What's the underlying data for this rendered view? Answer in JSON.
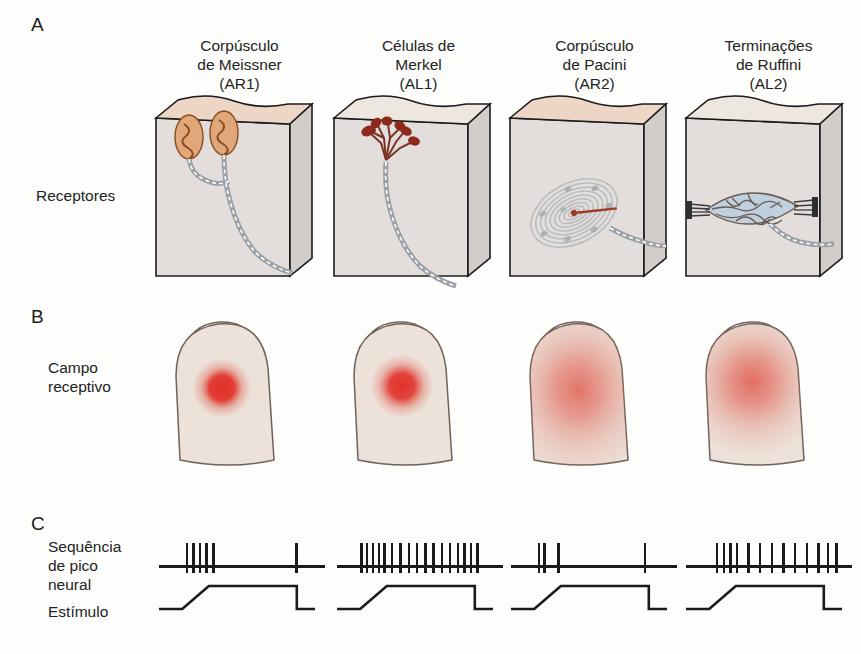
{
  "figure": {
    "panels": [
      {
        "letter": "A",
        "row_label": "Receptores"
      },
      {
        "letter": "B",
        "row_label": "Campo\nreceptivo"
      },
      {
        "letter": "C",
        "row_label_spikes": "Sequência\nde pico\nneural",
        "row_label_stimulus": "Estímulo"
      }
    ]
  },
  "columns": [
    {
      "id": "meissner",
      "title": "Corpúsculo\nde Meissner",
      "code": "(AR1)"
    },
    {
      "id": "merkel",
      "title": "Células de\nMerkel",
      "code": "(AL1)"
    },
    {
      "id": "pacini",
      "title": "Corpúsculo\nde Pacini",
      "code": "(AR2)"
    },
    {
      "id": "ruffini",
      "title": "Terminações\nde Ruffini",
      "code": "(AL2)"
    }
  ],
  "colors": {
    "skin_top": "#eed6c6",
    "skin_front": "#e3dedb",
    "skin_side": "#d2cdc9",
    "outline": "#1b1b1b",
    "meissner_capsule": "#e0a878",
    "meissner_fiber": "#8a4a20",
    "merkel_cell": "#8e2a1c",
    "merkel_branch": "#7a3322",
    "nerve": "#9aa0a6",
    "pacini_lamella": "#b9bcbf",
    "pacini_core": "#9c3b22",
    "ruffini_capsule": "#bfd0de",
    "ruffini_fiber": "#6b5a52",
    "receptive_field": "#e03028",
    "finger_fill": "#ece2da",
    "finger_outline": "#6e625a",
    "trace": "#1b1b1b"
  },
  "chart_data": {
    "type": "line",
    "stimulus": {
      "label": "Estímulo",
      "shape": "trapezoid",
      "baseline_end_pct": 14,
      "ramp_end_pct": 30,
      "plateau_end_pct": 83,
      "offset_end_pct": 88,
      "amplitude": 1.0
    },
    "series": [
      {
        "name": "Corpúsculo de Meissner (AR1)",
        "code": "AR1",
        "adaptation": "rapidamente adaptativo",
        "receptive_field_size": "pequeno",
        "spike_count": 6,
        "spike_times_pct": [
          16,
          20,
          24,
          28,
          32,
          82
        ]
      },
      {
        "name": "Células de Merkel (AL1)",
        "code": "AL1",
        "adaptation": "lentamente adaptativo",
        "receptive_field_size": "pequeno",
        "spike_count": 17,
        "spike_times_pct": [
          14,
          17.5,
          21,
          24.5,
          28,
          32.5,
          37.5,
          42.5,
          47.5,
          52.5,
          57.5,
          62.5,
          67.5,
          72,
          76,
          80,
          84
        ]
      },
      {
        "name": "Corpúsculo de Pacini (AR2)",
        "code": "AR2",
        "adaptation": "rapidamente adaptativo",
        "receptive_field_size": "grande",
        "spike_count": 4,
        "spike_times_pct": [
          16,
          19.5,
          28,
          80
        ]
      },
      {
        "name": "Terminações de Ruffini (AL2)",
        "code": "AL2",
        "adaptation": "lentamente adaptativo",
        "receptive_field_size": "grande",
        "spike_count": 13,
        "spike_times_pct": [
          18,
          22,
          26,
          30,
          37,
          44,
          51,
          58,
          65,
          72,
          79,
          85,
          90
        ]
      }
    ],
    "receptive_fields": [
      {
        "series": "AR1",
        "radius_pct": 13,
        "blur_pct": 9,
        "intensity": 1.0
      },
      {
        "series": "AL1",
        "radius_pct": 13,
        "blur_pct": 10,
        "intensity": 1.0
      },
      {
        "series": "AR2",
        "radius_pct": 40,
        "blur_pct": 34,
        "intensity": 0.55
      },
      {
        "series": "AL2",
        "radius_pct": 36,
        "blur_pct": 30,
        "intensity": 0.6
      }
    ]
  }
}
